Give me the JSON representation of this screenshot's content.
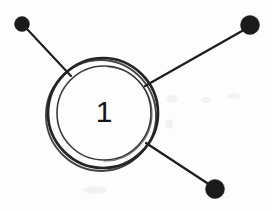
{
  "diagram": {
    "background_color": "#fdfdfd",
    "ink_color": "#1b1b1b",
    "width": 271,
    "height": 212,
    "center_label": {
      "text": "1",
      "x": 104,
      "y": 113,
      "font_size": 30
    },
    "rings": [
      {
        "name": "outer-ring",
        "cx": 103,
        "cy": 113,
        "rx": 55,
        "ry": 55,
        "stroke_width": 2.6,
        "color": "#242424"
      },
      {
        "name": "inner-ring",
        "cx": 104,
        "cy": 113,
        "rx": 47,
        "ry": 47,
        "stroke_width": 1.5,
        "color": "#3a3a3a"
      }
    ],
    "nodes": [
      {
        "id": "node-top-left",
        "label": "top-left node",
        "cx": 22,
        "cy": 24,
        "r": 7.5,
        "color": "#1b1b1b",
        "line": {
          "x1": 27,
          "y1": 29,
          "x2": 71,
          "y2": 76,
          "stroke_width": 2.1
        }
      },
      {
        "id": "node-top-right",
        "label": "top-right node",
        "cx": 250,
        "cy": 25,
        "r": 9.5,
        "color": "#1b1b1b",
        "line": {
          "x1": 242,
          "y1": 31,
          "x2": 145,
          "y2": 86,
          "stroke_width": 2.2
        }
      },
      {
        "id": "node-bottom-right",
        "label": "bottom-right node",
        "cx": 215,
        "cy": 189,
        "r": 9.5,
        "color": "#1b1b1b",
        "line": {
          "x1": 207,
          "y1": 183,
          "x2": 146,
          "y2": 143,
          "stroke_width": 2.2
        }
      }
    ]
  }
}
